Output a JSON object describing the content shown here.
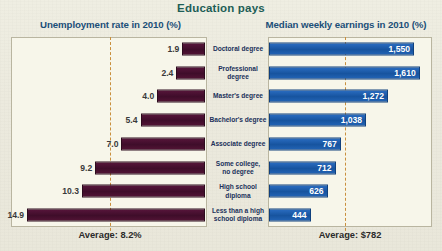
{
  "title": "Education pays",
  "headers": {
    "left": "Unemployment rate in 2010 (%)",
    "right": "Median weekly earnings in 2010 (%)"
  },
  "averages": {
    "left": "Average: 8.2%",
    "right": "Average: $782"
  },
  "chart_data": {
    "type": "bar",
    "title": "Education pays",
    "orientation": "horizontal-diverging",
    "categories": [
      "Doctoral degree",
      "Professional degree",
      "Master's degree",
      "Bachelor's degree",
      "Associate degree",
      "Some college, no degree",
      "High school diploma",
      "Less than a high school diploma"
    ],
    "category_labels": [
      "Doctoral degree",
      "Professional degree",
      "Master's degree",
      "Bachelor's degree",
      "Associate degree",
      "Some college,\nno degree",
      "High school\ndiploma",
      "Less than a high\nschool diploma"
    ],
    "series": [
      {
        "name": "Unemployment rate in 2010 (%)",
        "side": "left",
        "color": "#4a1030",
        "unit": "%",
        "values": [
          1.9,
          2.4,
          4.0,
          5.4,
          7.0,
          9.2,
          10.3,
          14.9
        ],
        "value_labels": [
          "1.9",
          "2.4",
          "4.0",
          "5.4",
          "7.0",
          "9.2",
          "10.3",
          "14.9"
        ],
        "average": 8.2,
        "average_label": "Average: 8.2%",
        "axis_max": 16.0
      },
      {
        "name": "Median weekly earnings in 2010 (%)",
        "side": "right",
        "color": "#1b5fb0",
        "unit": "$",
        "values": [
          1550,
          1610,
          1272,
          1038,
          767,
          712,
          626,
          444
        ],
        "value_labels": [
          "1,550",
          "1,610",
          "1,272",
          "1,038",
          "767",
          "712",
          "626",
          "444"
        ],
        "average": 782,
        "average_label": "Average: $782",
        "axis_max": 1720
      }
    ],
    "grid": false,
    "legend": "none",
    "xlabel": "",
    "ylabel": ""
  },
  "colors": {
    "title": "#1d5e56",
    "header": "#1b4f78",
    "left_bar": "#4a1030",
    "right_bar": "#1b5fb0",
    "reference_line": "#c98f3c",
    "panel_bg": "#f7f6ea",
    "page_bg": "#eceade"
  }
}
